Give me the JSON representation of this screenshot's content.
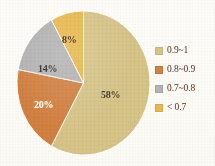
{
  "chart_data": {
    "type": "pie",
    "title": "",
    "subtitle": "",
    "xlabel": "",
    "ylabel": "",
    "grid": false,
    "legend_position": "right",
    "categories": [
      "0.9~1",
      "0.8~0.9",
      "0.7~0.8",
      "< 0.7"
    ],
    "values": [
      58,
      20,
      14,
      8
    ],
    "value_unit": "%",
    "data_labels": [
      "58%",
      "20%",
      "14%",
      "8%"
    ],
    "colors": [
      "#d6c487",
      "#d1803f",
      "#b3b3b3",
      "#e8b84a"
    ],
    "start_angle_deg": 0,
    "direction": "clockwise",
    "slices": [
      {
        "label": "0.9~1",
        "value": 58,
        "data_label": "58%",
        "color": "#d6c487"
      },
      {
        "label": "0.8~0.9",
        "value": 20,
        "data_label": "20%",
        "color": "#d1803f"
      },
      {
        "label": "0.7~0.8",
        "value": 14,
        "data_label": "14%",
        "color": "#b3b3b3"
      },
      {
        "label": "< 0.7",
        "value": 8,
        "data_label": "8%",
        "color": "#e8b84a"
      }
    ]
  },
  "legend": {
    "items": [
      {
        "label": "0.9~1",
        "color": "#d6c487"
      },
      {
        "label": "0.8~0.9",
        "color": "#d1803f"
      },
      {
        "label": "0.7~0.8",
        "color": "#b3b3b3"
      },
      {
        "label": "< 0.7",
        "color": "#e8b84a"
      }
    ]
  },
  "labels": {
    "slice_0": "58%",
    "slice_1": "20%",
    "slice_2": "14%",
    "slice_3": "8%"
  },
  "theme": {
    "background": "#fdfcf8",
    "legend_text": "#5d2f23",
    "label_dark": "#4a3b2c",
    "label_light": "#fffdf6"
  }
}
